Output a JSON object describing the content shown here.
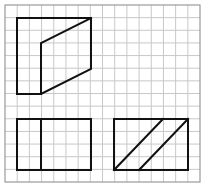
{
  "diagram": {
    "type": "orthographic-projection-grid",
    "grid": {
      "x0": 5,
      "y0": 5,
      "x1": 200,
      "y1": 182,
      "cols": 16,
      "rows": 14,
      "line_color": "#c8c8c8",
      "border_color": "#9a9a9a"
    },
    "stroke_color": "#111111",
    "stroke_width": 2,
    "shapes": [
      {
        "name": "top-view-polygon",
        "kind": "polygon",
        "points": [
          [
            17,
            18
          ],
          [
            91,
            18
          ],
          [
            91,
            69
          ],
          [
            41,
            94
          ],
          [
            17,
            94
          ]
        ]
      },
      {
        "name": "top-view-inner-edge",
        "kind": "polyline",
        "points": [
          [
            41,
            94
          ],
          [
            41,
            43
          ],
          [
            91,
            18
          ]
        ]
      },
      {
        "name": "front-view-rect",
        "kind": "rect",
        "x": 17,
        "y": 119,
        "w": 74,
        "h": 51
      },
      {
        "name": "front-view-divider",
        "kind": "line",
        "points": [
          [
            41,
            119
          ],
          [
            41,
            170
          ]
        ]
      },
      {
        "name": "side-view-rect",
        "kind": "rect",
        "x": 114,
        "y": 119,
        "w": 74,
        "h": 51
      },
      {
        "name": "side-view-diagonal-1",
        "kind": "line",
        "points": [
          [
            114,
            170
          ],
          [
            163,
            119
          ]
        ]
      },
      {
        "name": "side-view-diagonal-2",
        "kind": "line",
        "points": [
          [
            139,
            170
          ],
          [
            188,
            119
          ]
        ]
      }
    ]
  }
}
